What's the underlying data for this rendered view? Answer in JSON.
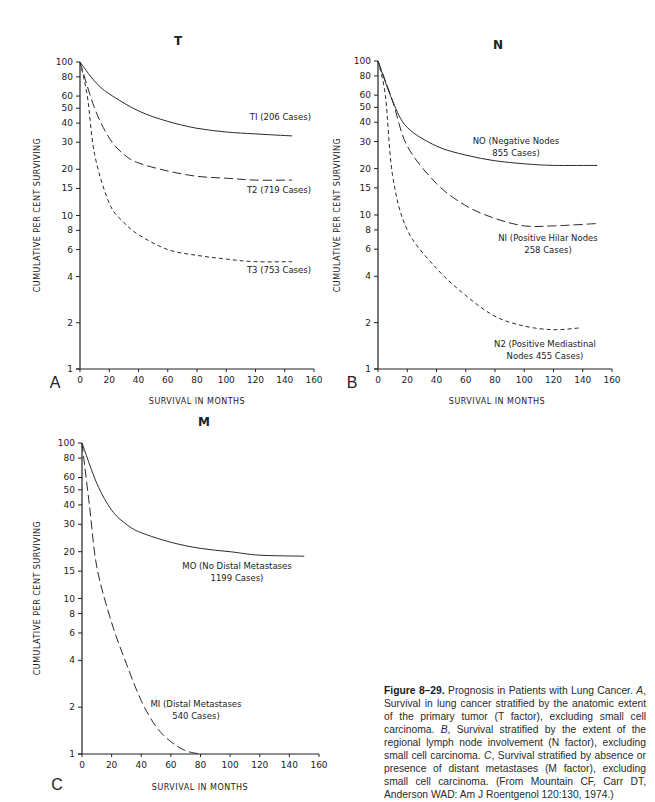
{
  "figure": {
    "caption_label": "Figure 8–29.",
    "caption_title": " Prognosis in Patients with Lung Cancer. ",
    "caption_parts": [
      {
        "text": "A",
        "italic": true
      },
      {
        "text": ", Survival in lung cancer stratified by the anatomic extent of the primary tumor (T factor), excluding small cell carcinoma. ",
        "italic": false
      },
      {
        "text": "B",
        "italic": true
      },
      {
        "text": ", Survival stratified by the extent of the regional lymph node involvement (N factor), excluding small cell carcinoma. ",
        "italic": false
      },
      {
        "text": "C",
        "italic": true
      },
      {
        "text": ", Survival stratified by absence or presence of distant metastases (M factor), excluding small cell carcinoma. (From Mountain CF, Carr DT, Anderson WAD: Am J Roentgenol 120:130, 1974.)",
        "italic": false
      }
    ]
  },
  "chart_data": [
    {
      "panel": "A",
      "type": "line",
      "title": "T",
      "xlabel": "SURVIVAL IN MONTHS",
      "ylabel": "CUMULATIVE PER CENT SURVIVING",
      "xlim": [
        0,
        160
      ],
      "ylim": [
        1,
        100
      ],
      "yscale": "log",
      "xticks": [
        0,
        20,
        40,
        60,
        80,
        100,
        120,
        140,
        160
      ],
      "yticks": [
        1,
        2,
        4,
        6,
        8,
        10,
        15,
        20,
        30,
        40,
        50,
        60,
        80,
        100
      ],
      "grid": false,
      "legend": "inline labels",
      "series": [
        {
          "name": "T1 (206 Cases)",
          "style": "solid",
          "x": [
            0,
            10,
            20,
            40,
            60,
            80,
            100,
            120,
            145
          ],
          "values": [
            100,
            75,
            62,
            48,
            41,
            37,
            35,
            34,
            33
          ]
        },
        {
          "name": "T2 (719 Cases)",
          "style": "long-dash",
          "x": [
            0,
            10,
            20,
            30,
            40,
            60,
            80,
            100,
            120,
            145
          ],
          "values": [
            100,
            50,
            32,
            25,
            22,
            19.5,
            18,
            17.5,
            17,
            17
          ]
        },
        {
          "name": "T3 (753 Cases)",
          "style": "short-dash",
          "x": [
            0,
            5,
            10,
            20,
            30,
            40,
            60,
            80,
            100,
            120,
            145
          ],
          "values": [
            100,
            60,
            25,
            12,
            9,
            7.5,
            6,
            5.5,
            5.2,
            5,
            5
          ]
        }
      ]
    },
    {
      "panel": "B",
      "type": "line",
      "title": "N",
      "xlabel": "SURVIVAL IN MONTHS",
      "ylabel": "CUMULATIVE PER CENT SURVIVING",
      "xlim": [
        0,
        160
      ],
      "ylim": [
        1,
        100
      ],
      "yscale": "log",
      "xticks": [
        0,
        20,
        40,
        60,
        80,
        100,
        120,
        140,
        160
      ],
      "yticks": [
        1,
        2,
        4,
        6,
        8,
        10,
        15,
        20,
        30,
        40,
        50,
        60,
        80,
        100
      ],
      "grid": false,
      "legend": "inline labels",
      "series": [
        {
          "name": "N0 (Negative Nodes 855 Cases)",
          "style": "solid",
          "x": [
            0,
            10,
            20,
            40,
            60,
            80,
            100,
            120,
            150
          ],
          "values": [
            100,
            55,
            37,
            28,
            24.5,
            22.5,
            21.5,
            21,
            21
          ]
        },
        {
          "name": "N1 (Positive Hilar Nodes 258 Cases)",
          "style": "long-dash",
          "x": [
            0,
            10,
            20,
            40,
            60,
            80,
            100,
            120,
            150
          ],
          "values": [
            100,
            55,
            28,
            16,
            11.5,
            9.5,
            8.5,
            8.5,
            8.8
          ]
        },
        {
          "name": "N2 (Positive Mediastinal Nodes 455 Cases)",
          "style": "short-dash",
          "x": [
            0,
            5,
            10,
            20,
            40,
            60,
            80,
            100,
            120,
            138
          ],
          "values": [
            100,
            60,
            18,
            8,
            4.5,
            3,
            2.2,
            1.9,
            1.8,
            1.85
          ]
        }
      ]
    },
    {
      "panel": "C",
      "type": "line",
      "title": "M",
      "xlabel": "SURVIVAL IN MONTHS",
      "ylabel": "CUMULATIVE PER CENT SURVIVING",
      "xlim": [
        0,
        160
      ],
      "ylim": [
        1,
        100
      ],
      "yscale": "log",
      "xticks": [
        0,
        20,
        40,
        60,
        80,
        100,
        120,
        140,
        160
      ],
      "yticks": [
        1,
        2,
        4,
        6,
        8,
        10,
        15,
        20,
        30,
        40,
        50,
        60,
        80,
        100
      ],
      "grid": false,
      "legend": "inline labels",
      "series": [
        {
          "name": "M0 (No Distal Metastases 1199 Cases)",
          "style": "solid",
          "x": [
            0,
            10,
            20,
            30,
            40,
            60,
            80,
            100,
            120,
            150
          ],
          "values": [
            100,
            55,
            37,
            30,
            26.5,
            23,
            21,
            20,
            19,
            18.7
          ]
        },
        {
          "name": "M1 (Distal Metastases 540 Cases)",
          "style": "long-dash",
          "x": [
            0,
            5,
            10,
            20,
            30,
            40,
            50,
            60,
            70,
            80
          ],
          "values": [
            100,
            40,
            16,
            7,
            3.8,
            2.2,
            1.5,
            1.2,
            1.05,
            1
          ]
        }
      ]
    }
  ],
  "panels": {
    "A": {
      "letter": "A",
      "title": "T",
      "xlabel": "SURVIVAL IN MONTHS",
      "ylabel": "CUMULATIVE PER CENT SURVIVING",
      "labels": [
        {
          "lines": [
            "TI (206 Cases)"
          ],
          "x": 311,
          "y": 120,
          "anchor": "end"
        },
        {
          "lines": [
            "T2 (719 Cases)"
          ],
          "x": 311,
          "y": 193,
          "anchor": "end"
        },
        {
          "lines": [
            "T3 (753 Cases)"
          ],
          "x": 311,
          "y": 273,
          "anchor": "end"
        }
      ]
    },
    "B": {
      "letter": "B",
      "title": "N",
      "xlabel": "SURVIVAL IN MONTHS",
      "ylabel": "CUMULATIVE PER CENT SURVIVING",
      "labels": [
        {
          "lines": [
            "NO (Negative Nodes",
            "855 Cases)"
          ],
          "x": 516,
          "y": 144,
          "anchor": "middle"
        },
        {
          "lines": [
            "NI (Positive Hilar Nodes",
            "258 Cases)"
          ],
          "x": 548,
          "y": 241,
          "anchor": "middle"
        },
        {
          "lines": [
            "N2 (Positive Mediastinal",
            "Nodes 455 Cases)"
          ],
          "x": 545,
          "y": 347,
          "anchor": "middle"
        }
      ]
    },
    "C": {
      "letter": "C",
      "title": "M",
      "xlabel": "SURVIVAL IN MONTHS",
      "ylabel": "CUMULATIVE PER CENT SURVIVING",
      "labels": [
        {
          "lines": [
            "MO (No Distal Metastases",
            "1199 Cases)"
          ],
          "x": 237,
          "y": 569,
          "anchor": "middle"
        },
        {
          "lines": [
            "MI (Distal Metastases",
            "540 Cases)"
          ],
          "x": 196,
          "y": 707,
          "anchor": "middle"
        }
      ]
    }
  }
}
